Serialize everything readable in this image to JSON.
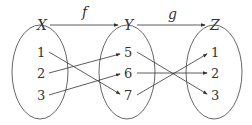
{
  "sets": [
    {
      "label": "X",
      "elements": [
        "1",
        "2",
        "3"
      ]
    },
    {
      "label": "Y",
      "elements": [
        "5",
        "6",
        "7"
      ]
    },
    {
      "label": "Z",
      "elements": [
        "1",
        "2",
        "3"
      ]
    }
  ],
  "functions": [
    {
      "label": "f",
      "from": "X",
      "to": "Y",
      "mapping": [
        [
          "1",
          "7"
        ],
        [
          "2",
          "5"
        ],
        [
          "3",
          "6"
        ]
      ]
    },
    {
      "label": "g",
      "from": "Y",
      "to": "Z",
      "mapping": [
        [
          "5",
          "3"
        ],
        [
          "6",
          "2"
        ],
        [
          "7",
          "1"
        ]
      ]
    }
  ]
}
